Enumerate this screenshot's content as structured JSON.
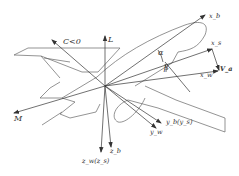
{
  "diagram": {
    "type": "aircraft coordinate frames",
    "line_color": "#555555",
    "labels": {
      "x_b": "x_b",
      "x_s": "x_s",
      "x_w": "x_w",
      "V_a": "V_a",
      "alpha": "α",
      "beta": "β",
      "C": "C<0",
      "L": "L",
      "M": "M",
      "y_b_ys": "y_b(y_s)",
      "y_w": "y_w",
      "z_w_zs": "z_w(z_s)",
      "z_b": "z_b"
    }
  }
}
